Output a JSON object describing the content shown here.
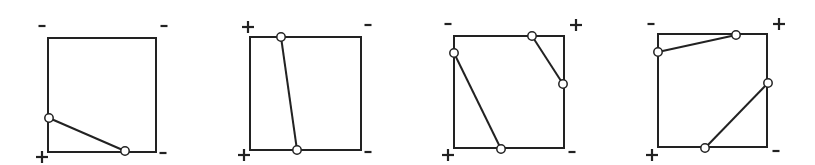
{
  "diagram": {
    "panels": [
      {
        "id": "panel-1",
        "square": {
          "x": 48,
          "y": 38,
          "w": 108,
          "h": 114
        },
        "corner_signs": {
          "top_left": "-",
          "top_right": "-",
          "bottom_left": "+",
          "bottom_right": "-"
        },
        "sign_positions": {
          "top_left": [
            42,
            26
          ],
          "top_right": [
            164,
            26
          ],
          "bottom_left": [
            42,
            157
          ],
          "bottom_right": [
            163,
            153
          ]
        },
        "segments": [
          {
            "from": [
              49,
              118
            ],
            "to": [
              125,
              151
            ]
          }
        ]
      },
      {
        "id": "panel-2",
        "square": {
          "x": 250,
          "y": 37,
          "w": 111,
          "h": 113
        },
        "corner_signs": {
          "top_left": "+",
          "top_right": "-",
          "bottom_left": "+",
          "bottom_right": "-"
        },
        "sign_positions": {
          "top_left": [
            248,
            27
          ],
          "top_right": [
            368,
            25
          ],
          "bottom_left": [
            244,
            155
          ],
          "bottom_right": [
            368,
            152
          ]
        },
        "segments": [
          {
            "from": [
              281,
              37
            ],
            "to": [
              297,
              150
            ]
          }
        ]
      },
      {
        "id": "panel-3",
        "square": {
          "x": 454,
          "y": 36,
          "w": 110,
          "h": 112
        },
        "corner_signs": {
          "top_left": "-",
          "top_right": "+",
          "bottom_left": "+",
          "bottom_right": "-"
        },
        "sign_positions": {
          "top_left": [
            448,
            24
          ],
          "top_right": [
            576,
            25
          ],
          "bottom_left": [
            448,
            155
          ],
          "bottom_right": [
            572,
            152
          ]
        },
        "segments": [
          {
            "from": [
              454,
              53
            ],
            "to": [
              501,
              149
            ]
          },
          {
            "from": [
              532,
              36
            ],
            "to": [
              563,
              84
            ]
          }
        ]
      },
      {
        "id": "panel-4",
        "square": {
          "x": 658,
          "y": 34,
          "w": 109,
          "h": 113
        },
        "corner_signs": {
          "top_left": "-",
          "top_right": "+",
          "bottom_left": "+",
          "bottom_right": "-"
        },
        "sign_positions": {
          "top_left": [
            651,
            24
          ],
          "top_right": [
            779,
            24
          ],
          "bottom_left": [
            652,
            155
          ],
          "bottom_right": [
            776,
            151
          ]
        },
        "segments": [
          {
            "from": [
              658,
              52
            ],
            "to": [
              736,
              35
            ]
          },
          {
            "from": [
              768,
              83
            ],
            "to": [
              705,
              148
            ]
          }
        ]
      }
    ]
  }
}
